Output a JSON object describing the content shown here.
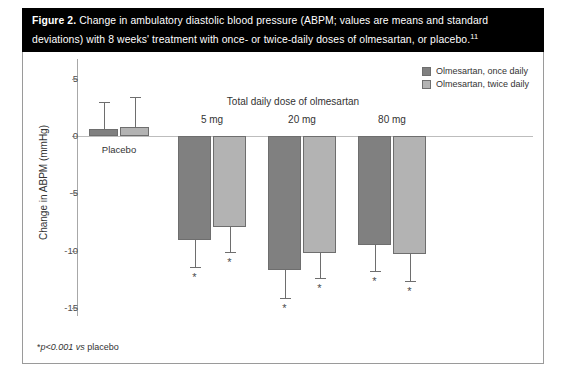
{
  "caption": {
    "label": "Figure 2.",
    "text": " Change in ambulatory diastolic blood pressure (ABPM; values are means and standard deviations) with 8 weeks' treatment with once- or twice-daily doses of olmesartan, or placebo.",
    "reference": "11"
  },
  "legend": {
    "items": [
      {
        "label": "Olmesartan, once daily",
        "color": "#808080"
      },
      {
        "label": "Olmesartan, twice daily",
        "color": "#b3b3b3"
      }
    ]
  },
  "footnote": {
    "star": "*",
    "p": "p<0.001 ",
    "vs": "vs",
    "rest": " placebo"
  },
  "chart_data": {
    "type": "bar",
    "title": "Total daily dose of olmesartan",
    "xlabel": "Total daily dose of olmesartan",
    "ylabel": "Change in ABPM (mmHg)",
    "ylim": [
      -15,
      5
    ],
    "yticks": [
      5,
      0,
      -5,
      -10,
      -15
    ],
    "ytick_labels": [
      "5",
      "0",
      "-5",
      "-10",
      "-15"
    ],
    "grid": false,
    "legend_position": "top-right",
    "categories": [
      "Placebo",
      "5 mg",
      "20 mg",
      "80 mg"
    ],
    "series": [
      {
        "name": "Olmesartan, once daily",
        "color": "#808080",
        "values": [
          0.6,
          -9.1,
          -11.7,
          -9.5
        ],
        "errors": [
          2.4,
          2.3,
          2.4,
          2.3
        ],
        "significant": [
          false,
          true,
          true,
          true
        ]
      },
      {
        "name": "Olmesartan, twice daily",
        "color": "#b3b3b3",
        "values": [
          0.8,
          -7.9,
          -10.2,
          -10.3
        ],
        "errors": [
          2.6,
          2.2,
          2.2,
          2.3
        ],
        "significant": [
          false,
          true,
          true,
          true
        ]
      }
    ],
    "significance_marker": "*",
    "annotations": [
      "*p<0.001 vs placebo"
    ]
  }
}
